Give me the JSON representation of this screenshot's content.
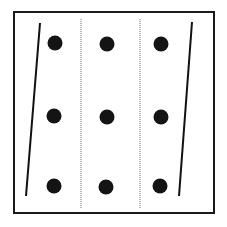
{
  "figure": {
    "canvas": {
      "width": 227,
      "height": 227,
      "background": "#ffffff"
    },
    "frame": {
      "name": "outer-frame",
      "x": 14,
      "y": 12,
      "width": 200,
      "height": 201,
      "stroke": "#1a1a1a",
      "stroke_width": 2,
      "fill": "#ffffff"
    },
    "solid_lines": [
      {
        "name": "left-slanted-line",
        "x1": 40,
        "y1": 23,
        "x2": 26,
        "y2": 196,
        "stroke": "#111111",
        "stroke_width": 2
      },
      {
        "name": "right-slanted-line",
        "x1": 192,
        "y1": 22,
        "x2": 179,
        "y2": 196,
        "stroke": "#111111",
        "stroke_width": 2
      }
    ],
    "dotted_lines": [
      {
        "name": "left-dotted-line",
        "x1": 81,
        "y1": 19,
        "x2": 81,
        "y2": 208,
        "stroke": "#6b6b6b",
        "stroke_width": 1,
        "dash": "1 1"
      },
      {
        "name": "right-dotted-line",
        "x1": 140,
        "y1": 19,
        "x2": 140,
        "y2": 208,
        "stroke": "#6b6b6b",
        "stroke_width": 1,
        "dash": "1 1"
      }
    ],
    "dots": {
      "color": "#141414",
      "radius": 7.5,
      "columns_x": [
        55,
        107,
        161
      ],
      "rows_y": [
        43,
        116,
        186
      ],
      "points": [
        {
          "name": "dot-r1-c1",
          "cx": 55,
          "cy": 43
        },
        {
          "name": "dot-r1-c2",
          "cx": 107,
          "cy": 44
        },
        {
          "name": "dot-r1-c3",
          "cx": 161,
          "cy": 44
        },
        {
          "name": "dot-r2-c1",
          "cx": 54,
          "cy": 116
        },
        {
          "name": "dot-r2-c2",
          "cx": 107,
          "cy": 117
        },
        {
          "name": "dot-r2-c3",
          "cx": 161,
          "cy": 117
        },
        {
          "name": "dot-r3-c1",
          "cx": 54,
          "cy": 186
        },
        {
          "name": "dot-r3-c2",
          "cx": 106,
          "cy": 187
        },
        {
          "name": "dot-r3-c3",
          "cx": 160,
          "cy": 186
        }
      ]
    }
  }
}
